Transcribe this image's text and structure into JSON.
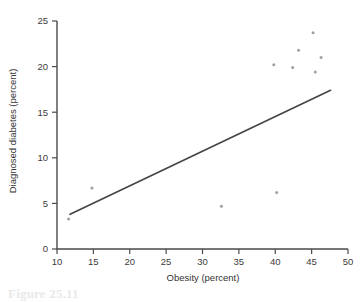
{
  "figure": {
    "background_color": "#ffffff",
    "partial_caption": "Figure 25.11"
  },
  "chart_data": {
    "type": "scatter",
    "title": "",
    "subtitle": "",
    "xlabel": "Obesity (percent)",
    "ylabel": "Diagnosed diabetes (percent)",
    "xlim": [
      10,
      50
    ],
    "ylim": [
      0,
      25
    ],
    "xticks": [
      10,
      15,
      20,
      25,
      30,
      35,
      40,
      45,
      50
    ],
    "yticks": [
      0,
      5,
      10,
      15,
      20,
      25
    ],
    "xtick_labels": [
      "10",
      "15",
      "20",
      "25",
      "30",
      "35",
      "40",
      "45",
      "50"
    ],
    "ytick_labels": [
      "0",
      "5",
      "10",
      "15",
      "20",
      "25"
    ],
    "grid": false,
    "legend": null,
    "legend_position": "none",
    "annotations": [],
    "point_color": "#9a9a9a",
    "point_radius": 1.35,
    "point_opacity": 0.85,
    "point_count": 3100,
    "axis_color": "#4a4a4a",
    "tick_color": "#4a4a4a",
    "series": [
      {
        "name": "Counties",
        "type": "scatter",
        "marker_color": "#9a9a9a",
        "x_center": 31.5,
        "y_center": 11.6,
        "x_spread": 4.6,
        "y_spread": 2.45,
        "correlation": 0.74,
        "x_min_observed": 11.6,
        "x_max_observed": 47.5,
        "y_min_observed": 3.3,
        "y_max_observed": 23.7
      },
      {
        "name": "Linear fit",
        "type": "line",
        "line_color": "#454545",
        "line_width": 1.7,
        "x_start": 11.8,
        "y_start": 3.8,
        "x_end": 47.6,
        "y_end": 17.4,
        "slope": 0.38,
        "intercept": -0.69
      }
    ],
    "outliers": [
      {
        "x": 45.2,
        "y": 23.7
      },
      {
        "x": 43.2,
        "y": 21.8
      },
      {
        "x": 46.3,
        "y": 21.0
      },
      {
        "x": 42.4,
        "y": 19.9
      },
      {
        "x": 45.5,
        "y": 19.4
      },
      {
        "x": 39.8,
        "y": 20.2
      },
      {
        "x": 11.6,
        "y": 3.3
      },
      {
        "x": 32.6,
        "y": 4.7
      },
      {
        "x": 14.8,
        "y": 6.7
      },
      {
        "x": 40.2,
        "y": 6.2
      }
    ]
  }
}
